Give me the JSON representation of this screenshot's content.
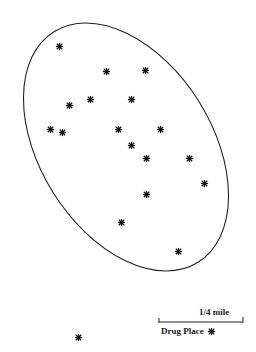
{
  "map": {
    "ellipse": {
      "cx": 126,
      "cy": 147,
      "rx": 136,
      "ry": 86,
      "rotation_deg": 58,
      "stroke": "#222222"
    },
    "points": [
      {
        "x": 59,
        "y": 46
      },
      {
        "x": 106,
        "y": 71
      },
      {
        "x": 145,
        "y": 70
      },
      {
        "x": 90,
        "y": 99
      },
      {
        "x": 131,
        "y": 99
      },
      {
        "x": 69,
        "y": 105
      },
      {
        "x": 50,
        "y": 129
      },
      {
        "x": 62,
        "y": 132
      },
      {
        "x": 118,
        "y": 129
      },
      {
        "x": 160,
        "y": 129
      },
      {
        "x": 131,
        "y": 145
      },
      {
        "x": 146,
        "y": 158
      },
      {
        "x": 189,
        "y": 158
      },
      {
        "x": 204,
        "y": 183
      },
      {
        "x": 146,
        "y": 194
      },
      {
        "x": 121,
        "y": 222
      },
      {
        "x": 178,
        "y": 251
      },
      {
        "x": 78,
        "y": 337
      }
    ],
    "point_icon": "asterisk-icon",
    "point_color": "#111111"
  },
  "legend": {
    "scale_label": "1/4 mile",
    "marker_label": "Drug Place",
    "marker_icon": "asterisk-icon"
  }
}
